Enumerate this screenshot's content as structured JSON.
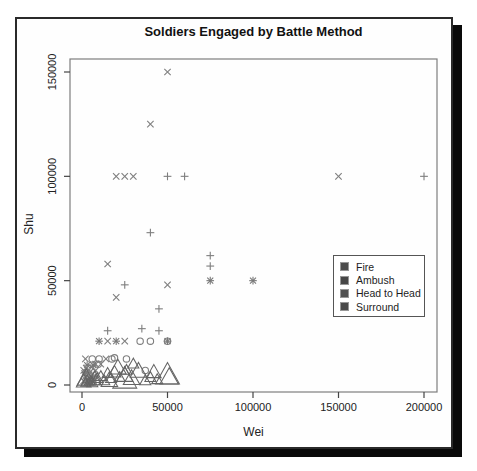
{
  "figure": {
    "title": "Soldiers Engaged by Battle Method",
    "x_axis_title": "Wei",
    "y_axis_title": "Shu"
  },
  "chart_data": {
    "type": "scatter",
    "title": "Soldiers Engaged by Battle Method",
    "xlabel": "Wei",
    "ylabel": "Shu",
    "xlim": [
      -9000,
      208000
    ],
    "ylim": [
      -6000,
      157000
    ],
    "grid": false,
    "x_tick_values": [
      0,
      50000,
      100000,
      150000,
      200000
    ],
    "x_tick_labels": [
      "0",
      "50000",
      "100000",
      "150000",
      "200000"
    ],
    "y_tick_values": [
      0,
      50000,
      100000,
      150000
    ],
    "y_tick_labels": [
      "0",
      "50000",
      "100000",
      "150000"
    ],
    "axis_color": "#444444",
    "box_color": "#7d7d7d",
    "tick_label_color": "#222222",
    "legend": {
      "position": "right-middle",
      "items": [
        {
          "label": "Fire",
          "marker": "filled-square",
          "color": "#4c4c4c"
        },
        {
          "label": "Ambush",
          "marker": "filled-square",
          "color": "#474747"
        },
        {
          "label": "Head to Head",
          "marker": "filled-square",
          "color": "#515151"
        },
        {
          "label": "Surround",
          "marker": "filled-square",
          "color": "#4a4a4a"
        }
      ]
    },
    "series": [
      {
        "name": "x-marks",
        "symbol": "x",
        "color": "#7e7e7e",
        "points": [
          [
            50000,
            150000
          ],
          [
            40000,
            125000
          ],
          [
            20000,
            100000
          ],
          [
            25000,
            100000
          ],
          [
            30000,
            100000
          ],
          [
            150000,
            100000
          ],
          [
            15000,
            58000
          ],
          [
            20000,
            42000
          ],
          [
            50000,
            48000
          ],
          [
            15000,
            21000
          ],
          [
            25000,
            21000
          ],
          [
            2000,
            12500
          ],
          [
            14000,
            12500
          ],
          [
            8000,
            10000
          ],
          [
            11000,
            10000
          ],
          [
            1000,
            2000
          ],
          [
            2000,
            4000
          ],
          [
            3000,
            6000
          ],
          [
            4500,
            3000
          ],
          [
            6000,
            5000
          ],
          [
            2500,
            8000
          ],
          [
            5500,
            8500
          ],
          [
            8000,
            7000
          ],
          [
            1500,
            5500
          ],
          [
            7000,
            2500
          ],
          [
            1500,
            1500
          ],
          [
            3500,
            1000
          ],
          [
            5000,
            6500
          ],
          [
            1000,
            7000
          ],
          [
            4000,
            5000
          ],
          [
            2500,
            2500
          ],
          [
            6500,
            4000
          ]
        ]
      },
      {
        "name": "plus-marks",
        "symbol": "plus",
        "color": "#7e7e7e",
        "points": [
          [
            50000,
            100000
          ],
          [
            60000,
            100000
          ],
          [
            200000,
            100000
          ],
          [
            40000,
            73000
          ],
          [
            75000,
            62000
          ],
          [
            75000,
            57000
          ],
          [
            25000,
            48000
          ],
          [
            45000,
            36500
          ],
          [
            15000,
            26000
          ],
          [
            35000,
            27000
          ],
          [
            45000,
            26000
          ]
        ]
      },
      {
        "name": "circles",
        "symbol": "circle",
        "color": "#7e7e7e",
        "points": [
          [
            34000,
            21000
          ],
          [
            40000,
            21000
          ],
          [
            50000,
            21000
          ],
          [
            6000,
            12500
          ],
          [
            10000,
            12500
          ],
          [
            17500,
            12500
          ],
          [
            26000,
            12500
          ],
          [
            9500,
            10000
          ],
          [
            37000,
            7000
          ],
          [
            19000,
            13000
          ]
        ]
      },
      {
        "name": "asterisks",
        "symbol": "asterisk",
        "color": "#787878",
        "points": [
          [
            75000,
            50000
          ],
          [
            100000,
            50000
          ],
          [
            10000,
            21000
          ],
          [
            20000,
            21000
          ],
          [
            50000,
            21000
          ],
          [
            3000,
            9500
          ],
          [
            6500,
            9500
          ],
          [
            4500,
            1500
          ],
          [
            2000,
            6000
          ]
        ]
      },
      {
        "name": "triangles",
        "symbol": "triangle",
        "color": "#646464",
        "points": [
          [
            1000,
            1500,
            8
          ],
          [
            2500,
            3000,
            10
          ],
          [
            2000,
            1000,
            5
          ],
          [
            4000,
            1500,
            5
          ],
          [
            6000,
            1000,
            6
          ],
          [
            8000,
            2000,
            6
          ],
          [
            3000,
            2500,
            5
          ],
          [
            5000,
            2000,
            5
          ],
          [
            9000,
            3000,
            6
          ],
          [
            7500,
            4000,
            6
          ],
          [
            11000,
            4000,
            6
          ],
          [
            13000,
            2000,
            6
          ],
          [
            15000,
            5500,
            6
          ],
          [
            17000,
            3000,
            6
          ],
          [
            19000,
            6000,
            7
          ],
          [
            22000,
            3500,
            6
          ],
          [
            26000,
            7000,
            6
          ],
          [
            30000,
            10000,
            6
          ],
          [
            37000,
            2000,
            6
          ],
          [
            40000,
            3500,
            6
          ],
          [
            44000,
            2500,
            6
          ],
          [
            16000,
            2000,
            9
          ],
          [
            21000,
            8000,
            9
          ],
          [
            25000,
            4500,
            9
          ],
          [
            29000,
            3000,
            9
          ],
          [
            33000,
            6500,
            9
          ],
          [
            42000,
            6000,
            8
          ],
          [
            25000,
            2500,
            13
          ],
          [
            50000,
            4500,
            13
          ],
          [
            51000,
            3500,
            10
          ]
        ]
      }
    ]
  }
}
